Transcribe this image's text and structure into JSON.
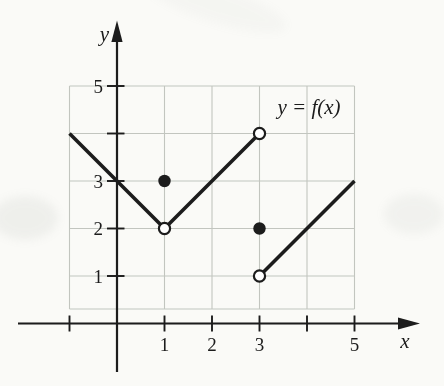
{
  "figure": {
    "title_label": "y = f(x)",
    "x_axis_label": "x",
    "y_axis_label": "y",
    "colors": {
      "background": "#fafaf7",
      "grid": "#c2c5bf",
      "ink": "#1b1b1b"
    }
  },
  "chart_data": {
    "type": "line",
    "title": "y = f(x)",
    "xlabel": "x",
    "ylabel": "y",
    "grid": {
      "on": true,
      "x_min": -1,
      "x_max": 5,
      "y_max": 5
    },
    "x_axis_ticks": [
      {
        "value": -1,
        "label": ""
      },
      {
        "value": 1,
        "label": "1"
      },
      {
        "value": 2,
        "label": "2"
      },
      {
        "value": 3,
        "label": "3"
      },
      {
        "value": 4,
        "label": ""
      },
      {
        "value": 5,
        "label": "5"
      }
    ],
    "y_axis_ticks": [
      {
        "value": 1,
        "label": "1"
      },
      {
        "value": 2,
        "label": "2"
      },
      {
        "value": 3,
        "label": "3"
      },
      {
        "value": 4,
        "label": ""
      },
      {
        "value": 5,
        "label": "5"
      }
    ],
    "segments": [
      {
        "x1": -1,
        "y1": 4,
        "x2": 1,
        "y2": 2,
        "left_end": "edge",
        "right_end": "open"
      },
      {
        "x1": 1,
        "y1": 2,
        "x2": 3,
        "y2": 4,
        "left_end": "open",
        "right_end": "open"
      },
      {
        "x1": 3,
        "y1": 1,
        "x2": 5,
        "y2": 3,
        "left_end": "open",
        "right_end": "edge"
      }
    ],
    "open_points": [
      {
        "x": 1,
        "y": 2
      },
      {
        "x": 3,
        "y": 4
      },
      {
        "x": 3,
        "y": 1
      }
    ],
    "closed_points": [
      {
        "x": 1,
        "y": 3
      },
      {
        "x": 3,
        "y": 2
      }
    ],
    "annotation": {
      "text": "y = f(x)",
      "anchor_x": 4.05,
      "anchor_y": 4.55
    }
  }
}
